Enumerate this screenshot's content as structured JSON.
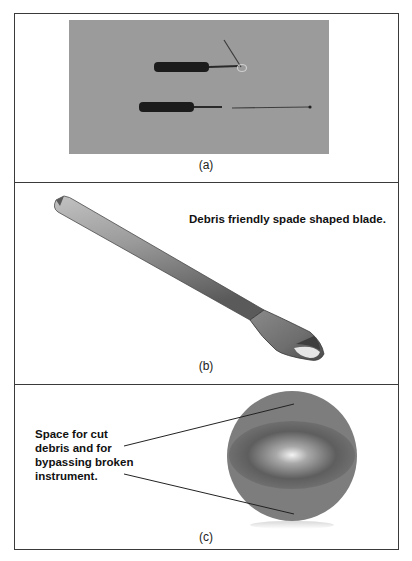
{
  "panels": {
    "a": {
      "caption": "(a)",
      "image": "photo-of-two-endodontic-instruments"
    },
    "b": {
      "caption": "(b)",
      "annotation": "Debris  friendly spade  shaped blade.",
      "image": "spade-shaped-instrument-render"
    },
    "c": {
      "caption": "(c)",
      "annotation": "Space for cut debris and for bypassing broken instrument.",
      "image": "cross-section-circle"
    }
  },
  "colors": {
    "border": "#3a3a3a",
    "photo_bg": "#9b9b9b",
    "instrument_dark": "#1a1a1a",
    "metal_mid": "#8c8c8c",
    "circle_fill": "#7d7d7d"
  }
}
